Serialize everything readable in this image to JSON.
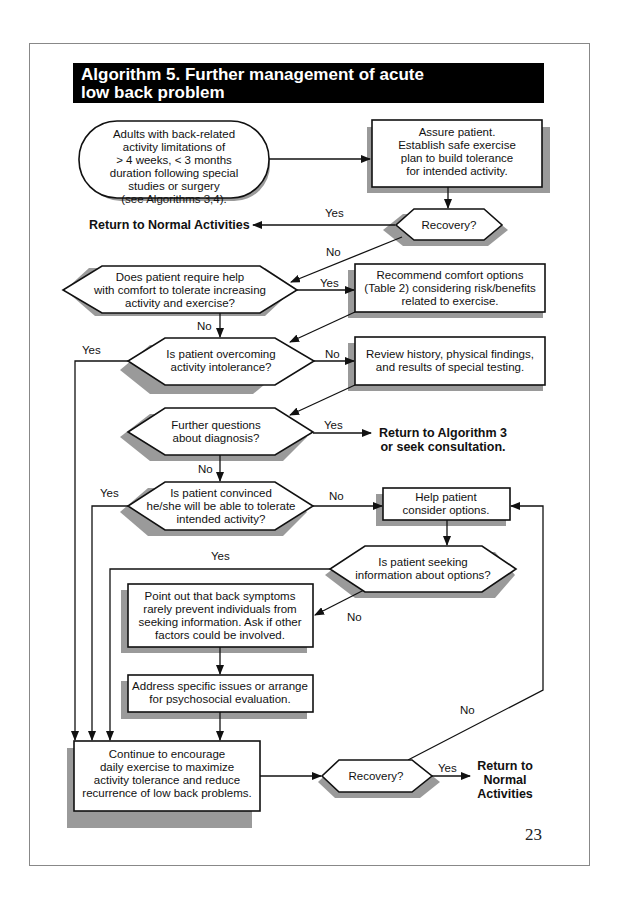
{
  "title": {
    "line1": "Algorithm 5.  Further management of acute",
    "line2": "low back problem"
  },
  "nodes": {
    "start": {
      "shape": "terminal",
      "lines": [
        "Adults with back-related",
        "activity limitations of",
        "> 4 weeks, < 3 months",
        "duration following special",
        "studies or surgery",
        "(see Algorithms 3,4)."
      ]
    },
    "assure": {
      "shape": "box",
      "lines": [
        "Assure patient.",
        "Establish safe exercise",
        "plan to build tolerance",
        "for intended activity."
      ]
    },
    "recovery1": {
      "shape": "decision",
      "lines": [
        "Recovery?"
      ]
    },
    "return_normal_1": {
      "shape": "outcome",
      "lines": [
        "Return to Normal Activities"
      ]
    },
    "comfort_help": {
      "shape": "decision",
      "lines": [
        "Does patient require help",
        "with comfort to tolerate increasing",
        "activity and exercise?"
      ]
    },
    "recommend": {
      "shape": "box",
      "lines": [
        "Recommend comfort options",
        "(Table 2) considering risk/benefits",
        "related to exercise."
      ]
    },
    "overcoming": {
      "shape": "decision",
      "lines": [
        "Is patient overcoming",
        "activity intolerance?"
      ]
    },
    "review": {
      "shape": "box",
      "lines": [
        "Review history, physical findings,",
        "and results of special testing."
      ]
    },
    "further_questions": {
      "shape": "decision",
      "lines": [
        "Further questions",
        "about diagnosis?"
      ]
    },
    "return_alg3": {
      "shape": "outcome",
      "lines": [
        "Return to Algorithm 3",
        "or seek consultation."
      ]
    },
    "convinced": {
      "shape": "decision",
      "lines": [
        "Is patient convinced",
        "he/she will be able to tolerate",
        "intended activity?"
      ]
    },
    "help_options": {
      "shape": "box",
      "lines": [
        "Help patient",
        "consider options."
      ]
    },
    "seeking_info": {
      "shape": "decision",
      "lines": [
        "Is patient seeking",
        "information about options?"
      ]
    },
    "point_out": {
      "shape": "box",
      "lines": [
        "Point out that back symptoms",
        "rarely prevent individuals from",
        "seeking information. Ask if other",
        "factors could be involved."
      ]
    },
    "address": {
      "shape": "box",
      "lines": [
        "Address specific issues or arrange",
        "for psychosocial evaluation."
      ]
    },
    "continue": {
      "shape": "box",
      "lines": [
        "Continue to encourage",
        "daily exercise to maximize",
        "activity tolerance and reduce",
        "recurrence of low back problems."
      ]
    },
    "recovery2": {
      "shape": "decision",
      "lines": [
        "Recovery?"
      ]
    },
    "return_normal_2": {
      "shape": "outcome",
      "lines": [
        "Return to",
        "Normal",
        "Activities"
      ]
    }
  },
  "edge_labels": {
    "recovery1_yes": "Yes",
    "recovery1_no": "No",
    "comfort_yes": "Yes",
    "comfort_no": "No",
    "overcoming_yes": "Yes",
    "overcoming_no": "No",
    "further_yes": "Yes",
    "further_no": "No",
    "convinced_yes": "Yes",
    "convinced_no": "No",
    "seeking_yes": "Yes",
    "seeking_no": "No",
    "recovery2_yes": "Yes",
    "recovery2_no": "No"
  },
  "page_number": "23"
}
